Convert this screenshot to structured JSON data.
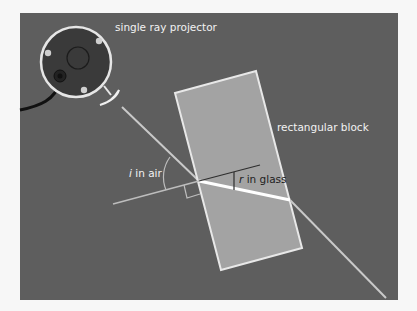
{
  "diagram": {
    "colors": {
      "page_bg": "#f7f7f7",
      "panel_bg": "#5e5e5e",
      "block_fill": "#a3a3a3",
      "block_edge": "#e8e8e8",
      "projector_body": "#3a3a3a",
      "projector_ring": "#e6e6e6",
      "ray": "#c9c9c9",
      "ray_inside": "#ffffff",
      "normal_outside": "#bdbdbd",
      "normal_inside": "#2e2e2e",
      "label_light": "#f2f2f2",
      "label_dark": "#1e1e1e"
    },
    "labels": {
      "projector": "single ray projector",
      "block": "rectangular block",
      "angle_i_symbol": "i",
      "angle_i_text": " in air",
      "angle_r_symbol": "r",
      "angle_r_text": " in glass"
    }
  }
}
